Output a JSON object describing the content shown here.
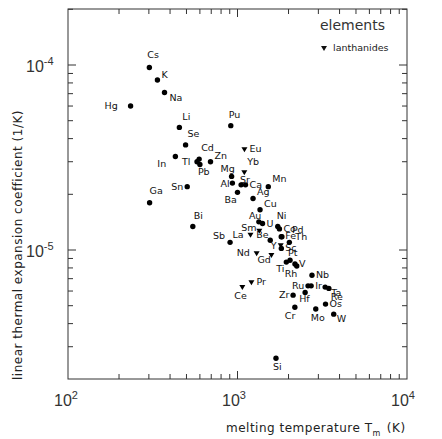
{
  "chart_data": {
    "type": "scatter",
    "title": "",
    "xlabel": "melting temperature T_m (K)",
    "ylabel": "linear thermal expansion coefficient (1/K)",
    "xscale": "log",
    "yscale": "log",
    "xlim": [
      100,
      10000
    ],
    "ylim": [
      1.55e-06,
      0.00019
    ],
    "grid": false,
    "legend": {
      "position": "upper right",
      "title": "elements",
      "entries": [
        {
          "marker": "triangle-down",
          "label": "lanthanides"
        }
      ]
    },
    "x_ticks": [
      "10^2",
      "10^3",
      "10^4"
    ],
    "y_ticks": [
      "10^-5",
      "10^-4"
    ],
    "series": [
      {
        "name": "elements",
        "marker": "circle",
        "points": [
          {
            "label": "Cs",
            "x": 302,
            "y": 9.7e-05
          },
          {
            "label": "K",
            "x": 337,
            "y": 8.3e-05
          },
          {
            "label": "Na",
            "x": 371,
            "y": 7.1e-05
          },
          {
            "label": "Hg",
            "x": 234,
            "y": 6e-05
          },
          {
            "label": "Li",
            "x": 454,
            "y": 4.6e-05
          },
          {
            "label": "Se",
            "x": 494,
            "y": 3.7e-05
          },
          {
            "label": "Cd",
            "x": 594,
            "y": 3.1e-05
          },
          {
            "label": "Zn",
            "x": 693,
            "y": 3e-05
          },
          {
            "label": "Tl",
            "x": 577,
            "y": 3e-05
          },
          {
            "label": "Pb",
            "x": 600,
            "y": 2.9e-05
          },
          {
            "label": "In",
            "x": 430,
            "y": 3.2e-05
          },
          {
            "label": "Sn",
            "x": 505,
            "y": 2.2e-05
          },
          {
            "label": "Ga",
            "x": 303,
            "y": 1.8e-05
          },
          {
            "label": "Bi",
            "x": 545,
            "y": 1.34e-05
          },
          {
            "label": "Sb",
            "x": 904,
            "y": 1.1e-05
          },
          {
            "label": "Pu",
            "x": 913,
            "y": 4.7e-05
          },
          {
            "label": "Mg",
            "x": 923,
            "y": 2.5e-05
          },
          {
            "label": "Al",
            "x": 933,
            "y": 2.3e-05
          },
          {
            "label": "Sr",
            "x": 1050,
            "y": 2.25e-05
          },
          {
            "label": "Ca",
            "x": 1115,
            "y": 2.25e-05
          },
          {
            "label": "Ba",
            "x": 1000,
            "y": 2.05e-05
          },
          {
            "label": "Mn",
            "x": 1519,
            "y": 2.2e-05
          },
          {
            "label": "Ag",
            "x": 1235,
            "y": 1.9e-05
          },
          {
            "label": "Cu",
            "x": 1358,
            "y": 1.65e-05
          },
          {
            "label": "Au",
            "x": 1337,
            "y": 1.42e-05
          },
          {
            "label": "U",
            "x": 1405,
            "y": 1.39e-05
          },
          {
            "label": "Ni",
            "x": 1728,
            "y": 1.34e-05
          },
          {
            "label": "Co",
            "x": 1768,
            "y": 1.3e-05
          },
          {
            "label": "Fe",
            "x": 1811,
            "y": 1.18e-05
          },
          {
            "label": "Pd",
            "x": 1828,
            "y": 1.18e-05
          },
          {
            "label": "Be",
            "x": 1560,
            "y": 1.13e-05
          },
          {
            "label": "Sc",
            "x": 1814,
            "y": 1.02e-05
          },
          {
            "label": "Th",
            "x": 2023,
            "y": 1.1e-05
          },
          {
            "label": "Pt",
            "x": 2041,
            "y": 8.8e-06
          },
          {
            "label": "Ti",
            "x": 1941,
            "y": 8.6e-06
          },
          {
            "label": "V",
            "x": 2183,
            "y": 8.4e-06
          },
          {
            "label": "Rh",
            "x": 2237,
            "y": 8.2e-06
          },
          {
            "label": "Nb",
            "x": 2750,
            "y": 7.3e-06
          },
          {
            "label": "Ta",
            "x": 3290,
            "y": 6.3e-06
          },
          {
            "label": "Ru",
            "x": 2607,
            "y": 6.4e-06
          },
          {
            "label": "Ir",
            "x": 2719,
            "y": 6.4e-06
          },
          {
            "label": "Re",
            "x": 3459,
            "y": 6.2e-06
          },
          {
            "label": "Zr",
            "x": 2128,
            "y": 5.7e-06
          },
          {
            "label": "Hf",
            "x": 2506,
            "y": 5.9e-06
          },
          {
            "label": "Os",
            "x": 3306,
            "y": 5.1e-06
          },
          {
            "label": "Cr",
            "x": 2180,
            "y": 4.9e-06
          },
          {
            "label": "Mo",
            "x": 2896,
            "y": 4.8e-06
          },
          {
            "label": "W",
            "x": 3695,
            "y": 4.5e-06
          },
          {
            "label": "Si",
            "x": 1687,
            "y": 2.6e-06
          }
        ]
      },
      {
        "name": "lanthanides",
        "marker": "triangle-down",
        "points": [
          {
            "label": "Eu",
            "x": 1099,
            "y": 3.5e-05
          },
          {
            "label": "Yb",
            "x": 1097,
            "y": 2.63e-05
          },
          {
            "label": "Sm",
            "x": 1345,
            "y": 1.27e-05
          },
          {
            "label": "La",
            "x": 1193,
            "y": 1.21e-05
          },
          {
            "label": "Nd",
            "x": 1297,
            "y": 9.6e-06
          },
          {
            "label": "Y",
            "x": 1799,
            "y": 1.06e-05
          },
          {
            "label": "Gd",
            "x": 1585,
            "y": 9.4e-06
          },
          {
            "label": "Pr",
            "x": 1208,
            "y": 6.7e-06
          },
          {
            "label": "Ce",
            "x": 1068,
            "y": 6.3e-06
          }
        ]
      }
    ]
  },
  "plot": {
    "legend_title": "elements",
    "legend_entry": "lanthanides",
    "ylabel": "linear thermal expansion coefficient (1/K)",
    "xlabel_main": "melting temperature T",
    "xlabel_sub": "m",
    "xlabel_unit": "(K)",
    "x_tick_base": "10",
    "x_tick_exps": [
      "2",
      "3",
      "4"
    ],
    "y_tick_base": "10",
    "y_tick_exps": [
      "-5",
      "-4"
    ]
  }
}
